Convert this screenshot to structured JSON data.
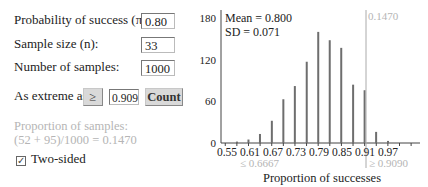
{
  "controls": {
    "probability_label": "Probability of success (π):",
    "probability_value": "0.80",
    "sample_size_label": "Sample size (n):",
    "sample_size_value": "33",
    "num_samples_label": "Number of samples:",
    "num_samples_value": "1000",
    "as_extreme_label": "As extreme as",
    "comparison_operator": "≥",
    "threshold_value": "0.909",
    "count_button": "Count",
    "proportion_line1": "Proportion of samples:",
    "proportion_line2": "(52 + 95)/1000 = 0.1470",
    "two_sided_label": "Two-sided",
    "two_sided_checked": true
  },
  "stats": {
    "mean_text": "Mean = 0.800",
    "sd_text": "SD = 0.071"
  },
  "chart_annotations": {
    "cutoff_label": "0.1470",
    "lower_tail_label": "≤ 0.6667",
    "upper_tail_label": "≥ 0.9090"
  },
  "colors": {
    "bar": "#6e6e6e",
    "axis": "#444444",
    "muted_text": "#b5b5b5",
    "cutoff_line": "#aaaaaa"
  },
  "chart_data": {
    "type": "bar",
    "title": "",
    "xlabel": "Proportion of successes",
    "ylabel": "",
    "x": [
      0.576,
      0.606,
      0.636,
      0.667,
      0.697,
      0.727,
      0.758,
      0.788,
      0.818,
      0.848,
      0.879,
      0.909,
      0.939,
      0.97
    ],
    "values": [
      2,
      5,
      13,
      32,
      63,
      82,
      117,
      160,
      148,
      137,
      84,
      76,
      16,
      3
    ],
    "x_tick_labels": [
      "0.55",
      "0.61",
      "0.67",
      "0.73",
      "0.79",
      "0.85",
      "0.91",
      "0.97"
    ],
    "y_ticks": [
      0,
      60,
      120,
      180
    ],
    "ylim": [
      0,
      185
    ],
    "xlim": [
      0.53,
      1.02
    ],
    "grid": false,
    "annotations": [
      "Mean = 0.800",
      "SD = 0.071",
      "0.1470",
      "≤ 0.6667",
      "≥ 0.9090"
    ]
  }
}
